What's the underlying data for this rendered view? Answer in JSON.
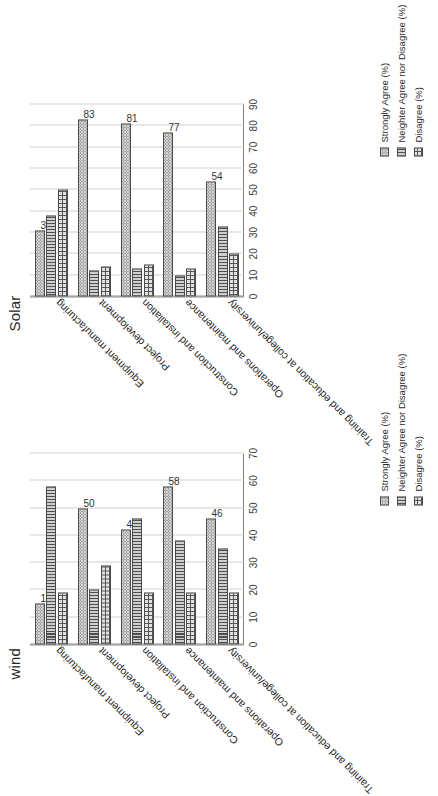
{
  "figure": {
    "orientation": "rotated-90",
    "panels": [
      "wind",
      "Solar"
    ]
  },
  "legend": {
    "position": "bottom-right",
    "entries": [
      {
        "label": "Strongly Agree (%)",
        "pattern": "dots"
      },
      {
        "label": "Neighter Agree nor Disagree (%)",
        "pattern": "vertical-lines"
      },
      {
        "label": "Disagree (%)",
        "pattern": "cross-hatch"
      }
    ]
  },
  "chart_data": [
    {
      "type": "bar",
      "title": "wind",
      "orientation": "vertical-grouped",
      "xlabel": "",
      "ylabel": "",
      "ylim": [
        0,
        70
      ],
      "yticks": [
        0,
        10,
        20,
        30,
        40,
        50,
        60,
        70
      ],
      "grid": true,
      "categories": [
        "Equipment manufacturing",
        "Project development",
        "Construction and installation",
        "Operations and maintenance",
        "Training and education at college/university"
      ],
      "series": [
        {
          "name": "Strongly Agree (%)",
          "values": [
            15,
            50,
            42,
            58,
            46
          ],
          "labeled": [
            15,
            50,
            42,
            58,
            46
          ]
        },
        {
          "name": "Neighter Agree nor Disagree (%)",
          "values": [
            58,
            20,
            46,
            38,
            35
          ]
        },
        {
          "name": "Disagree (%)",
          "values": [
            19,
            29,
            19,
            19,
            19
          ]
        }
      ]
    },
    {
      "type": "bar",
      "title": "Solar",
      "orientation": "vertical-grouped",
      "xlabel": "",
      "ylabel": "",
      "ylim": [
        0,
        90
      ],
      "yticks": [
        0,
        10,
        20,
        30,
        40,
        50,
        60,
        70,
        80,
        90
      ],
      "grid": true,
      "categories": [
        "Equipment manufacturing",
        "Project development",
        "Construction and installation",
        "Operations and maintenance",
        "Training and education at college/university"
      ],
      "series": [
        {
          "name": "Strongly Agree (%)",
          "values": [
            31,
            83,
            81,
            77,
            54
          ],
          "labeled": [
            31,
            83,
            81,
            77,
            54
          ]
        },
        {
          "name": "Neighter Agree nor Disagree (%)",
          "values": [
            38,
            12,
            13,
            10,
            33
          ]
        },
        {
          "name": "Disagree (%)",
          "values": [
            50,
            14,
            15,
            13,
            20
          ]
        }
      ]
    }
  ]
}
